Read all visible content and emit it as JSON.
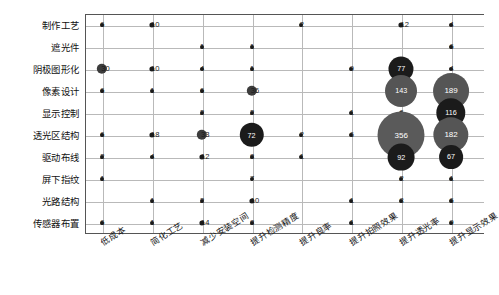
{
  "chart_data": {
    "type": "heatmap",
    "title": "",
    "xlabel": "",
    "ylabel": "",
    "grid": true,
    "legend": "none",
    "note": "Bubble matrix: bubble area and color encode the cell value. Small values are drawn as tiny dark dots with the number printed beside/over them; large values are drawn as large filled circles with the number inside in white.",
    "categories": [
      "低成本",
      "简化工艺",
      "减少安装空间",
      "提升检测精度",
      "提升良率",
      "提升拍照效果",
      "提升透光率",
      "提升显示效果"
    ],
    "rows": [
      "制作工艺",
      "遮光件",
      "阴极图形化",
      "像素设计",
      "显示控制",
      "透光区结构",
      "驱动布线",
      "屏下指纹",
      "光路结构",
      "传感器布置"
    ],
    "series": [
      {
        "name": "制作工艺",
        "values": [
          6,
          10,
          0,
          0,
          2,
          0,
          12,
          4
        ]
      },
      {
        "name": "遮光件",
        "values": [
          0,
          0,
          1,
          1,
          0,
          0,
          0,
          6
        ]
      },
      {
        "name": "阴极图形化",
        "values": [
          30,
          10,
          4,
          1,
          0,
          9,
          77,
          4
        ]
      },
      {
        "name": "像素设计",
        "values": [
          6,
          1,
          6,
          36,
          0,
          0,
          143,
          189
        ]
      },
      {
        "name": "显示控制",
        "values": [
          0,
          0,
          2,
          2,
          0,
          1,
          6,
          116
        ]
      },
      {
        "name": "透光区结构",
        "values": [
          6,
          18,
          33,
          72,
          2,
          6,
          356,
          182
        ]
      },
      {
        "name": "驱动布线",
        "values": [
          2,
          4,
          12,
          8,
          1,
          0,
          92,
          67
        ]
      },
      {
        "name": "屏下指纹",
        "values": [
          1,
          0,
          0,
          7,
          0,
          0,
          2,
          1
        ]
      },
      {
        "name": "光路结构",
        "values": [
          0,
          1,
          2,
          10,
          0,
          1,
          8,
          6
        ]
      },
      {
        "name": "传感器布置",
        "values": [
          6,
          1,
          14,
          8,
          0,
          1,
          0,
          9
        ]
      }
    ],
    "value_max": 356,
    "value_min": 0
  },
  "style": {
    "bubble_color_low": "#1b1b1b",
    "bubble_color_mid": "#3c3c3c",
    "bubble_color_high": "#5a5a5a",
    "grid_color": "#b9b9b9",
    "axis_color": "#555555",
    "label_color": "#111111",
    "value_text_color": "#ffffff",
    "background": "#ffffff"
  }
}
